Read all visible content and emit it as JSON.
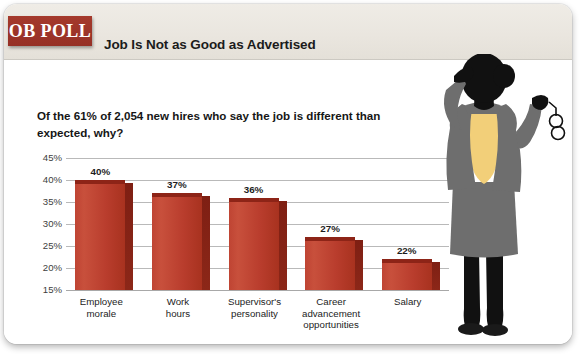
{
  "brand": {
    "badge_label": "OB POLL",
    "badge_color": "#9e3328",
    "header_band_color": "#eae6df"
  },
  "header": {
    "title": "Job Is Not as Good as Advertised"
  },
  "question": {
    "line1": "Of the 61% of 2,054 new hires who say the job is different than",
    "line2": "expected, why?"
  },
  "figure": {
    "name": "businesswoman-silhouette",
    "suit_color": "#6e6e6e",
    "blouse_color": "#f2cf79",
    "body_color": "#111111"
  },
  "chart_data": {
    "type": "bar",
    "title": "Job Is Not as Good as Advertised",
    "subtitle": "Of the 61% of 2,054 new hires who say the job is different than expected, why?",
    "xlabel": "",
    "ylabel": "",
    "ylim": [
      15,
      45
    ],
    "yticks": [
      "15%",
      "20%",
      "25%",
      "30%",
      "35%",
      "40%",
      "45%"
    ],
    "ytick_values": [
      15,
      20,
      25,
      30,
      35,
      40,
      45
    ],
    "grid": true,
    "legend": false,
    "bar_color": "#bf4433",
    "categories": [
      "Employee morale",
      "Work hours",
      "Supervisor's personality",
      "Career advancement opportunities",
      "Salary"
    ],
    "category_lines": [
      [
        "Employee",
        "morale"
      ],
      [
        "Work",
        "hours"
      ],
      [
        "Supervisor's",
        "personality"
      ],
      [
        "Career",
        "advancement",
        "opportunities"
      ],
      [
        "Salary"
      ]
    ],
    "values": [
      40,
      37,
      36,
      27,
      22
    ],
    "value_labels": [
      "40%",
      "37%",
      "36%",
      "27%",
      "22%"
    ]
  }
}
